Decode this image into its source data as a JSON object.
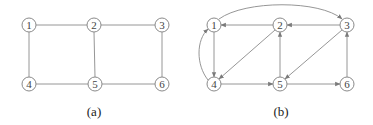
{
  "colors": {
    "edge": "#8a8a8a",
    "node_stroke": "#8a8a8a",
    "label": "#444444",
    "caption": "#222222",
    "background": "#ffffff"
  },
  "panel_a": {
    "caption": "(a)",
    "directed": false,
    "nodes": [
      {
        "id": "1",
        "label": "1"
      },
      {
        "id": "2",
        "label": "2"
      },
      {
        "id": "3",
        "label": "3"
      },
      {
        "id": "4",
        "label": "4"
      },
      {
        "id": "5",
        "label": "5"
      },
      {
        "id": "6",
        "label": "6"
      }
    ],
    "edges": [
      {
        "from": "1",
        "to": "2"
      },
      {
        "from": "2",
        "to": "3"
      },
      {
        "from": "1",
        "to": "4"
      },
      {
        "from": "2",
        "to": "5"
      },
      {
        "from": "3",
        "to": "6"
      },
      {
        "from": "4",
        "to": "5"
      },
      {
        "from": "5",
        "to": "6"
      }
    ]
  },
  "panel_b": {
    "caption": "(b)",
    "directed": true,
    "nodes": [
      {
        "id": "1",
        "label": "1"
      },
      {
        "id": "2",
        "label": "2"
      },
      {
        "id": "3",
        "label": "3"
      },
      {
        "id": "4",
        "label": "4"
      },
      {
        "id": "5",
        "label": "5"
      },
      {
        "id": "6",
        "label": "6"
      }
    ],
    "edges": [
      {
        "from": "1",
        "to": "3",
        "curved": true
      },
      {
        "from": "2",
        "to": "1"
      },
      {
        "from": "3",
        "to": "2"
      },
      {
        "from": "1",
        "to": "4"
      },
      {
        "from": "4",
        "to": "1",
        "curved": true
      },
      {
        "from": "2",
        "to": "4"
      },
      {
        "from": "3",
        "to": "5"
      },
      {
        "from": "4",
        "to": "5"
      },
      {
        "from": "5",
        "to": "2"
      },
      {
        "from": "5",
        "to": "6"
      },
      {
        "from": "6",
        "to": "3"
      }
    ]
  }
}
